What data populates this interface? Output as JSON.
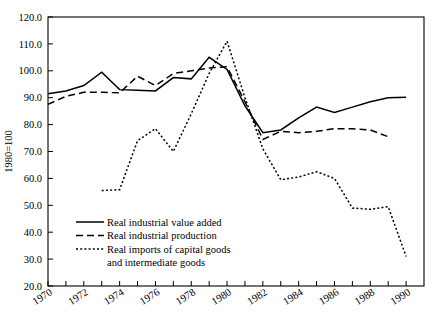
{
  "chart_data": {
    "type": "line",
    "title": "",
    "xlabel": "",
    "ylabel": "1980=100",
    "xlim": [
      1970,
      1991
    ],
    "ylim": [
      20.0,
      120.0
    ],
    "grid": false,
    "legend_position": "lower-left-inside",
    "x": [
      1970,
      1971,
      1972,
      1973,
      1974,
      1975,
      1976,
      1977,
      1978,
      1979,
      1980,
      1981,
      1982,
      1983,
      1984,
      1985,
      1986,
      1987,
      1988,
      1989,
      1990
    ],
    "ytick_labels": [
      "20.0",
      "30.0",
      "40.0",
      "50.0",
      "60.0",
      "70.0",
      "80.0",
      "90.0",
      "100.0",
      "110.0",
      "120.0"
    ],
    "ytick_values": [
      20,
      30,
      40,
      50,
      60,
      70,
      80,
      90,
      100,
      110,
      120
    ],
    "xtick_labels": [
      "1970",
      "1972",
      "1974",
      "1976",
      "1978",
      "1980",
      "1982",
      "1984",
      "1986",
      "1988",
      "1990"
    ],
    "xtick_values": [
      1970,
      1972,
      1974,
      1976,
      1978,
      1980,
      1982,
      1984,
      1986,
      1988,
      1990
    ],
    "xminor_values": [
      1971,
      1973,
      1975,
      1977,
      1979,
      1981,
      1983,
      1985,
      1987,
      1989
    ],
    "series": [
      {
        "name": "Real industrial value added",
        "style": "solid",
        "color": "#000000",
        "x": [
          1970,
          1971,
          1972,
          1973,
          1974,
          1975,
          1976,
          1977,
          1978,
          1979,
          1980,
          1981,
          1982,
          1983,
          1984,
          1985,
          1986,
          1987,
          1988,
          1989,
          1990
        ],
        "values": [
          91.5,
          92.5,
          94.5,
          99.5,
          93.0,
          92.8,
          92.5,
          97.5,
          97.0,
          105.0,
          100.5,
          87.0,
          77.0,
          78.0,
          82.5,
          86.5,
          84.5,
          86.5,
          88.5,
          90.0,
          90.2
        ]
      },
      {
        "name": "Real industrial production",
        "style": "dashed",
        "color": "#000000",
        "x": [
          1970,
          1971,
          1972,
          1973,
          1974,
          1975,
          1976,
          1977,
          1978,
          1979,
          1980,
          1981,
          1982,
          1983,
          1984,
          1985,
          1986,
          1987,
          1988,
          1989
        ],
        "values": [
          87.5,
          90.5,
          92.0,
          92.0,
          91.8,
          98.0,
          94.5,
          99.0,
          100.0,
          101.0,
          101.5,
          88.5,
          74.5,
          77.5,
          77.0,
          77.5,
          78.5,
          78.5,
          78.0,
          75.5
        ]
      },
      {
        "name": "Real imports of capital goods and intermediate goods",
        "style": "dotted",
        "color": "#000000",
        "x": [
          1973,
          1974,
          1975,
          1976,
          1977,
          1978,
          1979,
          1980,
          1981,
          1982,
          1983,
          1984,
          1985,
          1986,
          1987,
          1988,
          1989,
          1990
        ],
        "values": [
          55.5,
          55.8,
          74.0,
          78.5,
          70.0,
          84.0,
          99.0,
          111.0,
          90.0,
          71.0,
          59.5,
          60.5,
          62.5,
          60.0,
          49.0,
          48.5,
          49.5,
          31.0
        ]
      }
    ]
  },
  "legend": {
    "entries": [
      {
        "label": "Real industrial value added",
        "style": "solid"
      },
      {
        "label": "Real industrial production",
        "style": "dashed"
      },
      {
        "label": "Real imports of capital goods",
        "label_line2": "and intermediate goods",
        "style": "dotted"
      }
    ]
  }
}
